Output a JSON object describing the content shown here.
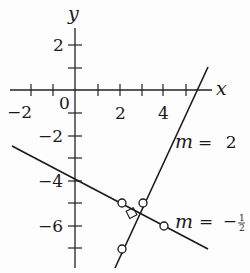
{
  "diagram": {
    "type": "coordinate-plane",
    "axes": {
      "x_label": "x",
      "y_label": "y",
      "origin_label": "0",
      "x_ticks": [
        -2,
        -1,
        1,
        2,
        3,
        4,
        5
      ],
      "x_tick_labels": [
        "-2",
        "2",
        "4"
      ],
      "y_ticks": [
        2,
        1,
        -1,
        -2,
        -3,
        -4,
        -5,
        -6,
        -7
      ],
      "y_tick_labels": [
        "2",
        "-2",
        "-4",
        "-6"
      ]
    },
    "lines": [
      {
        "name": "steep-line",
        "label": "m = 2",
        "slope": 2,
        "intercept": -11
      },
      {
        "name": "shallow-line",
        "label": "m = −½",
        "slope": -0.5,
        "intercept": -4
      }
    ],
    "points": [
      {
        "x": 2,
        "y": -5,
        "on": "m = -1/2"
      },
      {
        "x": 4,
        "y": -6,
        "on": "m = -1/2"
      },
      {
        "x": 3,
        "y": -5,
        "on": "m = 2"
      },
      {
        "x": 2,
        "y": -7,
        "on": "m = 2"
      }
    ],
    "right_angle_marker": {
      "x": 2.8,
      "y": -5.4
    },
    "labels": {
      "m2_m": "m",
      "m2_eq": "= 2",
      "mhalf_m": "m",
      "mhalf_eq": "= −",
      "half_num": "1",
      "half_den": "2",
      "tick_x_neg2": "−2",
      "tick_x_2": "2",
      "tick_x_4": "4",
      "tick_y_2": "2",
      "tick_y_neg2": "−2",
      "tick_y_neg4": "−4",
      "tick_y_neg6": "−6"
    }
  }
}
